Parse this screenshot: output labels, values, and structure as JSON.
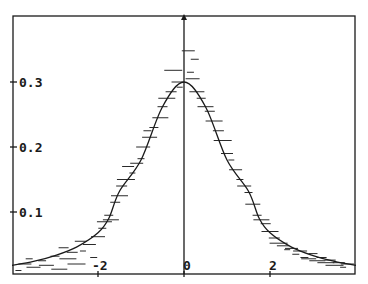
{
  "chart_data": {
    "type": "line",
    "title": "",
    "xlabel": "",
    "ylabel": "",
    "xlim": [
      -4,
      4
    ],
    "ylim": [
      0,
      0.4
    ],
    "grid": false,
    "legend": null,
    "x_ticks": [
      -2,
      0,
      2
    ],
    "x_tick_labels": [
      "-2",
      "0",
      "2"
    ],
    "y_ticks": [
      0.1,
      0.2,
      0.3
    ],
    "y_tick_labels": [
      "0.1",
      "0.2",
      "0.3"
    ],
    "series": [
      {
        "name": "fitted density curve",
        "style": "solid line",
        "x": [
          -4,
          -3.5,
          -3,
          -2.5,
          -2,
          -1.75,
          -1.5,
          -1,
          -0.5,
          0,
          0.5,
          1,
          1.5,
          1.75,
          2,
          2.5,
          3,
          3.5,
          4
        ],
        "y": [
          0.018,
          0.024,
          0.033,
          0.046,
          0.068,
          0.09,
          0.132,
          0.18,
          0.262,
          0.3,
          0.262,
          0.18,
          0.132,
          0.09,
          0.068,
          0.046,
          0.033,
          0.024,
          0.018
        ]
      },
      {
        "name": "sample histogram bins",
        "style": "horizontal dashes",
        "points": [
          [
            -3.85,
            0.01
          ],
          [
            -3.7,
            0.02
          ],
          [
            -3.6,
            0.028
          ],
          [
            -3.5,
            0.015
          ],
          [
            -3.3,
            0.025
          ],
          [
            -3.2,
            0.018
          ],
          [
            -3.0,
            0.032
          ],
          [
            -2.9,
            0.012
          ],
          [
            -2.8,
            0.045
          ],
          [
            -2.7,
            0.028
          ],
          [
            -2.6,
            0.038
          ],
          [
            -2.5,
            0.02
          ],
          [
            -2.4,
            0.055
          ],
          [
            -2.35,
            0.04
          ],
          [
            -2.2,
            0.05
          ],
          [
            -2.1,
            0.03
          ],
          [
            -2.0,
            0.062
          ],
          [
            -1.9,
            0.075
          ],
          [
            -1.85,
            0.085
          ],
          [
            -1.75,
            0.095
          ],
          [
            -1.7,
            0.088
          ],
          [
            -1.6,
            0.115
          ],
          [
            -1.5,
            0.125
          ],
          [
            -1.45,
            0.14
          ],
          [
            -1.35,
            0.15
          ],
          [
            -1.3,
            0.17
          ],
          [
            -1.2,
            0.16
          ],
          [
            -1.1,
            0.175
          ],
          [
            -1.0,
            0.182
          ],
          [
            -0.95,
            0.2
          ],
          [
            -0.85,
            0.225
          ],
          [
            -0.8,
            0.215
          ],
          [
            -0.7,
            0.23
          ],
          [
            -0.55,
            0.245
          ],
          [
            -0.5,
            0.262
          ],
          [
            -0.4,
            0.275
          ],
          [
            -0.3,
            0.285
          ],
          [
            -0.25,
            0.318
          ],
          [
            -0.15,
            0.3
          ],
          [
            -0.1,
            0.292
          ],
          [
            0.1,
            0.348
          ],
          [
            0.15,
            0.315
          ],
          [
            0.2,
            0.305
          ],
          [
            0.25,
            0.335
          ],
          [
            0.3,
            0.285
          ],
          [
            0.4,
            0.275
          ],
          [
            0.5,
            0.262
          ],
          [
            0.6,
            0.255
          ],
          [
            0.7,
            0.24
          ],
          [
            0.8,
            0.225
          ],
          [
            0.9,
            0.21
          ],
          [
            1.0,
            0.19
          ],
          [
            1.1,
            0.18
          ],
          [
            1.2,
            0.165
          ],
          [
            1.3,
            0.15
          ],
          [
            1.4,
            0.14
          ],
          [
            1.5,
            0.13
          ],
          [
            1.6,
            0.112
          ],
          [
            1.7,
            0.095
          ],
          [
            1.8,
            0.088
          ],
          [
            1.9,
            0.082
          ],
          [
            2.0,
            0.07
          ],
          [
            2.1,
            0.06
          ],
          [
            2.2,
            0.052
          ],
          [
            2.3,
            0.048
          ],
          [
            2.4,
            0.042
          ],
          [
            2.5,
            0.044
          ],
          [
            2.6,
            0.035
          ],
          [
            2.7,
            0.04
          ],
          [
            2.8,
            0.03
          ],
          [
            2.9,
            0.028
          ],
          [
            3.0,
            0.036
          ],
          [
            3.1,
            0.025
          ],
          [
            3.2,
            0.03
          ],
          [
            3.3,
            0.022
          ],
          [
            3.4,
            0.026
          ],
          [
            3.5,
            0.018
          ],
          [
            3.6,
            0.022
          ],
          [
            3.7,
            0.015
          ],
          [
            3.8,
            0.02
          ]
        ]
      }
    ]
  },
  "colors": {
    "axis": "#1a1a1a",
    "curve": "#1a1a1a",
    "dashes": "#2a2a2a",
    "background": "#ffffff"
  }
}
